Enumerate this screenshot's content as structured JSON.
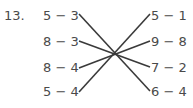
{
  "problem_number": "13.",
  "left_expressions": [
    "5 − 3",
    "8 − 3",
    "8 − 4",
    "5 − 4"
  ],
  "right_expressions": [
    "5 − 1",
    "9 − 8",
    "7 − 2",
    "6 − 4"
  ],
  "matches": [
    {
      "left": "5 − 3",
      "right": "6 − 4"
    },
    {
      "left": "8 − 3",
      "right": "7 − 2"
    },
    {
      "left": "8 − 4",
      "right": "9 − 8"
    },
    {
      "left": "5 − 4",
      "right": "5 − 1"
    }
  ],
  "line_color": "#3a3a3a"
}
